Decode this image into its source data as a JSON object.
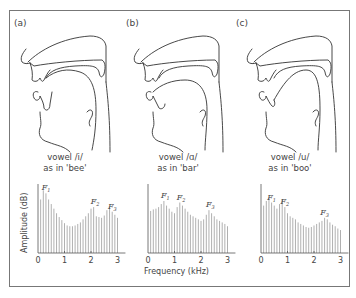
{
  "figure": {
    "panels": [
      {
        "label": "(a)",
        "caption_line1": "vowel /i/",
        "caption_line2": "as in 'bee'"
      },
      {
        "label": "(b)",
        "caption_line1": "vowel /ɑ/",
        "caption_line2": "as in 'bar'"
      },
      {
        "label": "(c)",
        "caption_line1": "vowel /u/",
        "caption_line2": "as in 'boo'"
      }
    ],
    "y_axis_label": "Amplitude (dB)",
    "x_axis_label": "Frequency (kHz)",
    "x_ticks": [
      "0",
      "1",
      "2",
      "3"
    ],
    "formant_labels": [
      "F1",
      "F2",
      "F3"
    ],
    "line_color": "#333333",
    "bar_color": "#b0b0b0"
  },
  "chart_data": [
    {
      "type": "bar",
      "title": "vowel /i/ as in 'bee'",
      "xlabel": "Frequency (kHz)",
      "ylabel": "Amplitude (dB)",
      "xlim": [
        0,
        3
      ],
      "x": [
        0.1,
        0.2,
        0.3,
        0.4,
        0.5,
        0.6,
        0.7,
        0.8,
        0.9,
        1.0,
        1.1,
        1.2,
        1.3,
        1.4,
        1.5,
        1.6,
        1.7,
        1.8,
        1.9,
        2.0,
        2.1,
        2.2,
        2.3,
        2.4,
        2.5,
        2.6,
        2.7,
        2.8,
        2.9,
        3.0
      ],
      "values": [
        70,
        82,
        78,
        70,
        64,
        58,
        52,
        47,
        43,
        39,
        36,
        35,
        35,
        36,
        38,
        40,
        44,
        48,
        52,
        58,
        60,
        48,
        47,
        46,
        49,
        56,
        60,
        54,
        50,
        46
      ],
      "annotations": [
        {
          "text": "F1",
          "x": 0.25
        },
        {
          "text": "F2",
          "x": 2.1
        },
        {
          "text": "F3",
          "x": 2.75
        }
      ]
    },
    {
      "type": "bar",
      "title": "vowel /ɑ/ as in 'bar'",
      "xlabel": "Frequency (kHz)",
      "ylabel": "Amplitude (dB)",
      "xlim": [
        0,
        3
      ],
      "x": [
        0.1,
        0.2,
        0.3,
        0.4,
        0.5,
        0.6,
        0.7,
        0.8,
        0.9,
        1.0,
        1.1,
        1.2,
        1.3,
        1.4,
        1.5,
        1.6,
        1.7,
        1.8,
        1.9,
        2.0,
        2.1,
        2.2,
        2.3,
        2.4,
        2.5,
        2.6,
        2.7,
        2.8,
        2.9,
        3.0
      ],
      "values": [
        55,
        57,
        58,
        60,
        64,
        68,
        62,
        58,
        54,
        52,
        60,
        66,
        62,
        58,
        54,
        50,
        48,
        46,
        44,
        42,
        44,
        50,
        56,
        52,
        48,
        44,
        42,
        40,
        38,
        35
      ],
      "annotations": [
        {
          "text": "F1",
          "x": 0.6
        },
        {
          "text": "F2",
          "x": 1.2
        },
        {
          "text": "F3",
          "x": 2.3
        }
      ]
    },
    {
      "type": "bar",
      "title": "vowel /u/ as in 'boo'",
      "xlabel": "Frequency (kHz)",
      "ylabel": "Amplitude (dB)",
      "xlim": [
        0,
        3
      ],
      "x": [
        0.1,
        0.2,
        0.3,
        0.4,
        0.5,
        0.6,
        0.7,
        0.8,
        0.9,
        1.0,
        1.1,
        1.2,
        1.3,
        1.4,
        1.5,
        1.6,
        1.7,
        1.8,
        1.9,
        2.0,
        2.1,
        2.2,
        2.3,
        2.4,
        2.5,
        2.6,
        2.7,
        2.8,
        2.9,
        3.0
      ],
      "values": [
        62,
        68,
        72,
        66,
        62,
        58,
        64,
        70,
        60,
        52,
        48,
        46,
        44,
        40,
        38,
        36,
        34,
        33,
        34,
        36,
        38,
        40,
        42,
        46,
        44,
        40,
        37,
        35,
        32,
        30
      ],
      "annotations": [
        {
          "text": "F1",
          "x": 0.35
        },
        {
          "text": "F2",
          "x": 0.85
        },
        {
          "text": "F3",
          "x": 2.35
        }
      ]
    }
  ]
}
